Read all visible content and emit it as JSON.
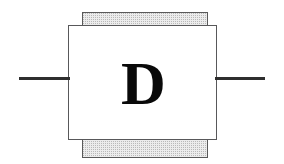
{
  "diagram": {
    "type": "schematic-symbol",
    "component_label": "D",
    "body": {
      "shape": "rectangle",
      "fill_color": "#ffffff",
      "stroke_color": "#58585a"
    },
    "bands": {
      "fill_color": "#ececec",
      "stipple_color": "#b9b9b9",
      "stroke_color": "#595959",
      "top_label": "",
      "bottom_label": ""
    },
    "leads": {
      "color": "#2e2e2e",
      "left_label": "",
      "right_label": ""
    }
  }
}
